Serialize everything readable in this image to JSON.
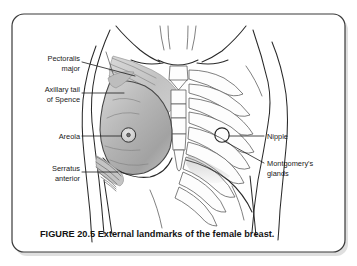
{
  "figure": {
    "caption": "FIGURE 20.5 External landmarks of the female breast.",
    "figure_number": "20.5",
    "subject": "External landmarks of the female breast",
    "illustration_name": "female-torso-breast-anatomy",
    "view": "anterior chest wall, left breast shaded, right side showing ribcage"
  },
  "colors": {
    "background": "#ffffff",
    "frame_border": "#3a3a3a",
    "outline": "#2a2a2a",
    "breast_shading": "#b0b0b0",
    "muscle_shading": "#c8c8c8",
    "label_text": "#1a1a1a",
    "caption_text": "#141414",
    "leader_line": "#1d1d1d"
  },
  "labels": {
    "left": [
      {
        "id": "pectoralis-major",
        "name": "label-pectoralis-major",
        "line1": "Pectoralis",
        "line2": "major",
        "align": "right"
      },
      {
        "id": "axillary-tail-of-spence",
        "name": "label-axillary-tail-of-spence",
        "line1": "Axillary tail",
        "line2": "of Spence",
        "align": "right"
      },
      {
        "id": "areola",
        "name": "label-areola",
        "line1": "Areola",
        "line2": "",
        "align": "right"
      },
      {
        "id": "serratus-anterior",
        "name": "label-serratus-anterior",
        "line1": "Serratus",
        "line2": "anterior",
        "align": "right"
      }
    ],
    "right": [
      {
        "id": "nipple",
        "name": "label-nipple",
        "line1": "Nipple",
        "line2": "",
        "align": "left"
      },
      {
        "id": "montgomerys-glands",
        "name": "label-montgomerys-glands",
        "line1": "Montgomery's",
        "line2": "glands",
        "align": "left"
      }
    ]
  }
}
